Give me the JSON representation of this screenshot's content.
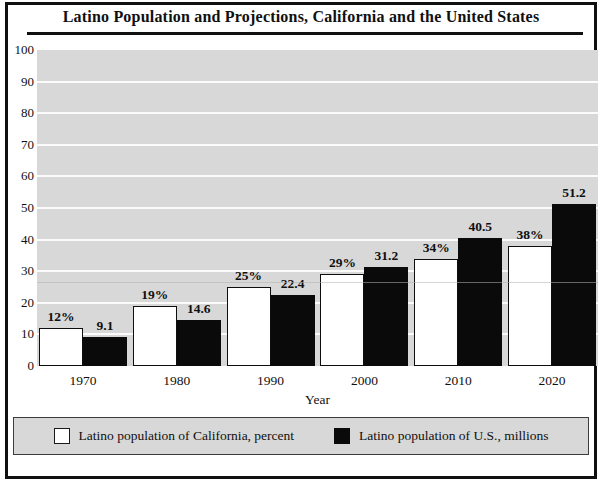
{
  "title": "Latino Population and Projections, California and the United States",
  "chart_data": {
    "type": "bar",
    "categories": [
      "1970",
      "1980",
      "1990",
      "2000",
      "2010",
      "2020"
    ],
    "series": [
      {
        "name": "Latino population of California, percent",
        "color": "#ffffff",
        "values": [
          12,
          19,
          25,
          29,
          34,
          38
        ],
        "labels": [
          "12%",
          "19%",
          "25%",
          "29%",
          "34%",
          "38%"
        ]
      },
      {
        "name": "Latino population of U.S., millions",
        "color": "#0a0a0a",
        "values": [
          9.1,
          14.6,
          22.4,
          31.2,
          40.5,
          51.2
        ],
        "labels": [
          "9.1",
          "14.6",
          "22.4",
          "31.2",
          "40.5",
          "51.2"
        ]
      }
    ],
    "xlabel": "Year",
    "ylabel": "",
    "ylim": [
      0,
      100
    ],
    "yticks": [
      0,
      10,
      20,
      30,
      40,
      50,
      60,
      70,
      80,
      90,
      100
    ],
    "grid": true,
    "legend_position": "bottom",
    "plot_bg": "#d8d8d8",
    "gridline_color": "#ffffff"
  }
}
